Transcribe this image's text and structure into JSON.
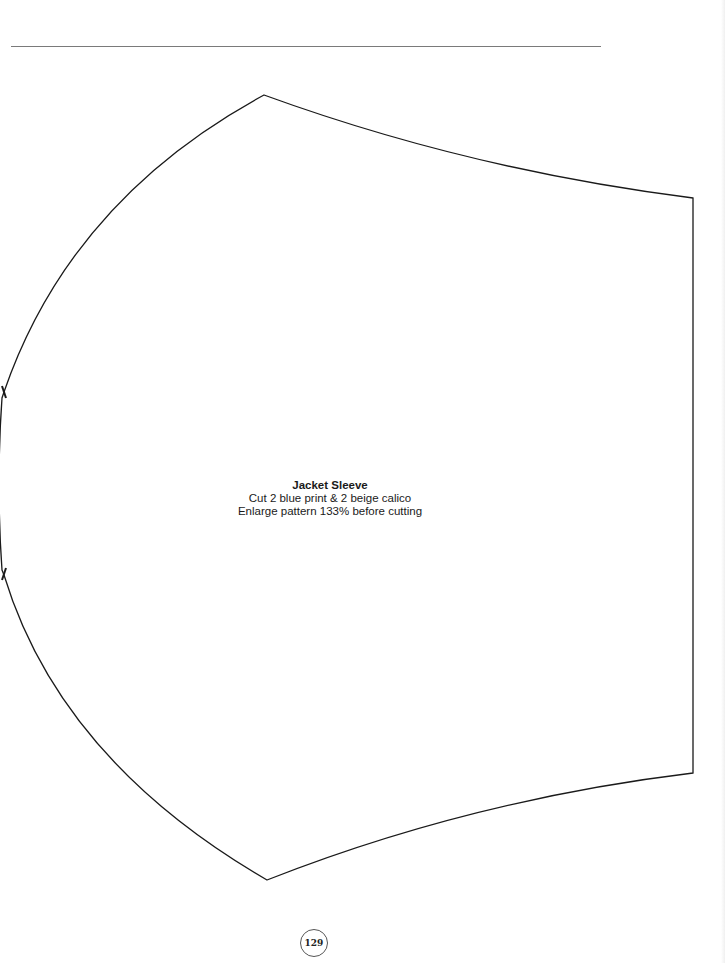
{
  "pattern": {
    "title": "Jacket Sleeve",
    "instructions": [
      "Cut 2 blue print & 2 beige calico",
      "Enlarge pattern 133% before cutting"
    ],
    "stroke_color": "#1a1a1a"
  },
  "page": {
    "number": "129",
    "rule_color": "#7a7a7a"
  }
}
